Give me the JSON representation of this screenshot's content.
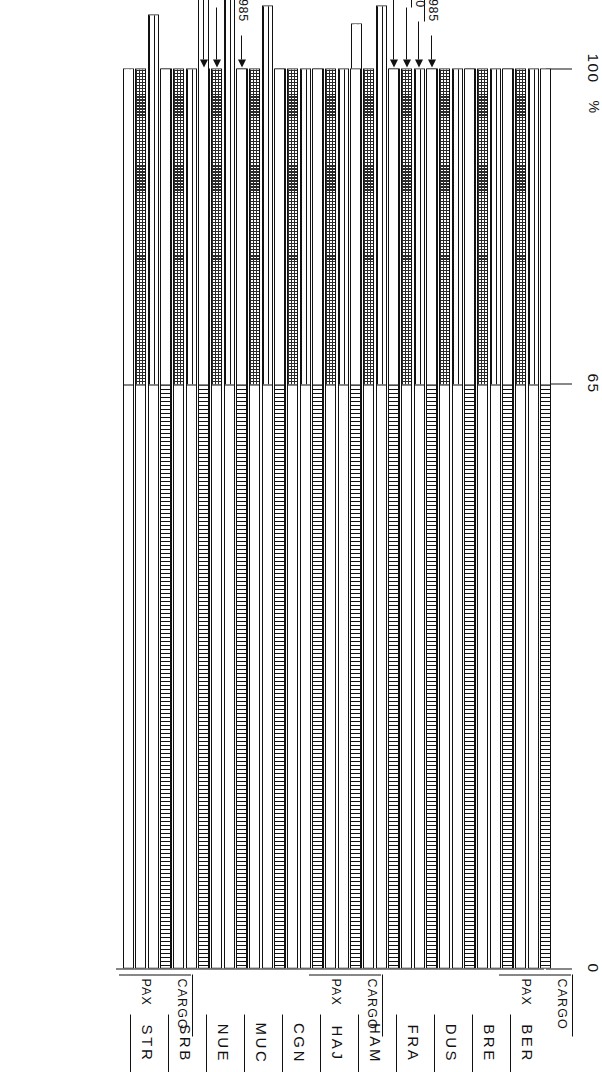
{
  "chart": {
    "type": "bar",
    "subtype": "100%-stacked-horizontal",
    "orientation": "rotated-90-landscape-page",
    "title": "",
    "xlabel": "",
    "ylabel": "",
    "unit_label": "%",
    "axis": {
      "ticks": [
        "100",
        "65",
        "0"
      ],
      "tick_values": [
        100,
        65,
        0
      ],
      "unit": "%",
      "range": [
        0,
        100
      ],
      "note_top": "100 %",
      "grid": false
    },
    "series_labels": [
      "PAX",
      "CARGO"
    ],
    "year_labels": [
      "1980",
      "1985"
    ],
    "bar_order": [
      "PAX 1980",
      "PAX 1985",
      "CARGO 1980",
      "CARGO 1985"
    ],
    "legend_position": "inline-callouts"
  },
  "chart_data": {
    "type": "bar",
    "title": "",
    "xlabel": "",
    "ylabel": "%",
    "ylim": [
      0,
      100
    ],
    "grid": false,
    "categories": [
      "BER",
      "BRE",
      "DUS",
      "FRA",
      "HAM",
      "HAJ",
      "CGN",
      "MUC",
      "NUE",
      "SRB",
      "STR"
    ],
    "tick_labels": [
      "100",
      "65",
      "0"
    ],
    "legend": [
      "PAX 1980",
      "PAX 1985",
      "CARGO 1980",
      "CARGO 1985"
    ],
    "series": [
      {
        "name": "PAX 1980",
        "values": [
          100,
          100,
          100,
          100,
          100,
          100,
          100,
          100,
          100,
          108,
          100
        ]
      },
      {
        "name": "PAX 1985",
        "values": [
          100,
          100,
          100,
          100,
          107,
          100,
          100,
          107,
          109,
          100,
          106
        ]
      },
      {
        "name": "CARGO 1980",
        "values": [
          100,
          100,
          100,
          100,
          100,
          100,
          100,
          100,
          100,
          100,
          100
        ]
      },
      {
        "name": "CARGO 1985",
        "values": [
          100,
          100,
          100,
          100,
          105,
          100,
          100,
          100,
          100,
          100,
          100
        ]
      }
    ],
    "split_point_pct": 65,
    "segments": {
      "note": "Each bar is split into a left (scheduled/domestic) portion and a right portion at roughly the 65 % gridline; fill patterns distinguish the four bars."
    }
  },
  "labels": {
    "pax": "PAX",
    "cargo": "CARGO",
    "percent": "%",
    "y1980": "1980",
    "y1985": "1985"
  },
  "colors": {
    "ink": "#111111",
    "paper": "#ffffff"
  }
}
